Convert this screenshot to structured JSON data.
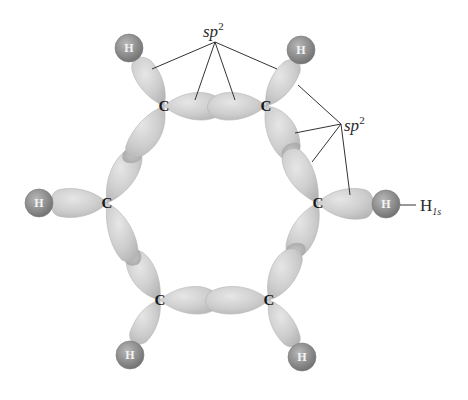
{
  "diagram": {
    "labels": {
      "sp2_top": {
        "text": "sp",
        "sup": "2"
      },
      "sp2_right": {
        "text": "sp",
        "sup": "2"
      },
      "h1s": {
        "text": "H",
        "sub": "1s"
      }
    },
    "carbon_label": "C",
    "hydrogen_label": "H",
    "atoms": [
      {
        "id": "C1",
        "element": "C",
        "x": 164,
        "y": 106
      },
      {
        "id": "C2",
        "element": "C",
        "x": 266,
        "y": 106
      },
      {
        "id": "C3",
        "element": "C",
        "x": 318,
        "y": 203
      },
      {
        "id": "C4",
        "element": "C",
        "x": 269,
        "y": 300
      },
      {
        "id": "C5",
        "element": "C",
        "x": 160,
        "y": 300
      },
      {
        "id": "C6",
        "element": "C",
        "x": 107,
        "y": 203
      },
      {
        "id": "H1",
        "element": "H",
        "x": 129,
        "y": 48
      },
      {
        "id": "H2",
        "element": "H",
        "x": 301,
        "y": 50
      },
      {
        "id": "H3",
        "element": "H",
        "x": 386,
        "y": 204
      },
      {
        "id": "H4",
        "element": "H",
        "x": 302,
        "y": 357
      },
      {
        "id": "H5",
        "element": "H",
        "x": 130,
        "y": 355
      },
      {
        "id": "H6",
        "element": "H",
        "x": 39,
        "y": 203
      }
    ],
    "colors": {
      "orbital_fill": "#cfcfcf",
      "hydrogen_fill": "#8f8f8f",
      "line": "#333333",
      "background": "#ffffff"
    }
  }
}
